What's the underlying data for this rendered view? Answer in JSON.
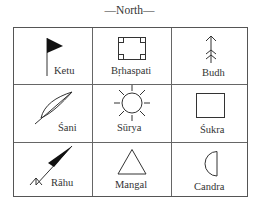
{
  "title": "—North—",
  "cells": [
    {
      "name": "Ketu",
      "symbol": "flag-icon"
    },
    {
      "name": "Bṛhaspati",
      "symbol": "square-corners-icon"
    },
    {
      "name": "Budh",
      "symbol": "arrow-up-icon"
    },
    {
      "name": "Śani",
      "symbol": "bow-icon"
    },
    {
      "name": "Sūrya",
      "symbol": "sun-icon"
    },
    {
      "name": "Śukra",
      "symbol": "square-icon"
    },
    {
      "name": "Rāhu",
      "symbol": "pennant-icon"
    },
    {
      "name": "Mangal",
      "symbol": "triangle-icon"
    },
    {
      "name": "Candra",
      "symbol": "half-moon-icon"
    }
  ],
  "colors": {
    "line": "#555555",
    "fill": "#111111",
    "text": "#333333"
  }
}
